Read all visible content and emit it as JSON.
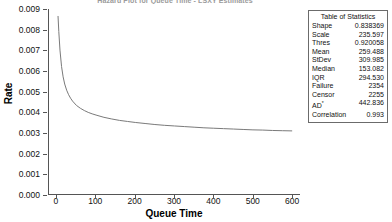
{
  "chart_data": {
    "type": "line",
    "title": "Hazard Plot for Queue Time - LSXY Estimates",
    "xlabel": "Queue Time",
    "ylabel": "Rate",
    "xlim": [
      -20,
      620
    ],
    "ylim": [
      0,
      0.009
    ],
    "grid": false,
    "legend": "none",
    "line_color": "#7a7a7a",
    "xticks": [
      "0",
      "100",
      "200",
      "300",
      "400",
      "500",
      "600"
    ],
    "xtick_values": [
      0,
      100,
      200,
      300,
      400,
      500,
      600
    ],
    "yticks": [
      "0.000",
      "0.001",
      "0.002",
      "0.003",
      "0.004",
      "0.005",
      "0.006",
      "0.007",
      "0.008",
      "0.009"
    ],
    "ytick_values": [
      0,
      0.001,
      0.002,
      0.003,
      0.004,
      0.005,
      0.006,
      0.007,
      0.008,
      0.009
    ],
    "series": [
      {
        "name": "Hazard rate",
        "x": [
          3,
          5,
          8,
          12,
          16,
          20,
          25,
          30,
          35,
          40,
          50,
          60,
          70,
          80,
          90,
          100,
          120,
          140,
          160,
          180,
          200,
          225,
          250,
          275,
          300,
          325,
          350,
          375,
          400,
          425,
          450,
          475,
          500,
          525,
          550,
          575,
          600
        ],
        "y": [
          0.00866,
          0.0079,
          0.007,
          0.0062,
          0.0057,
          0.00535,
          0.00505,
          0.00483,
          0.00466,
          0.00452,
          0.00431,
          0.00417,
          0.00406,
          0.00397,
          0.0039,
          0.00384,
          0.00373,
          0.00365,
          0.00358,
          0.00353,
          0.00348,
          0.00343,
          0.00338,
          0.00334,
          0.00331,
          0.00328,
          0.00325,
          0.00322,
          0.0032,
          0.00318,
          0.00316,
          0.00314,
          0.00312,
          0.00311,
          0.00309,
          0.00308,
          0.00307
        ]
      }
    ]
  },
  "stats_table": {
    "title": "Table of Statistics",
    "rows": [
      {
        "key": "Shape",
        "value": "0.838369"
      },
      {
        "key": "Scale",
        "value": "235.597"
      },
      {
        "key": "Thres",
        "value": "0.920058"
      },
      {
        "key": "Mean",
        "value": "259.488"
      },
      {
        "key": "StDev",
        "value": "309.985"
      },
      {
        "key": "Median",
        "value": "153.082"
      },
      {
        "key": "IQR",
        "value": "294.530"
      },
      {
        "key": "Failure",
        "value": "2354"
      },
      {
        "key": "Censor",
        "value": "2255"
      },
      {
        "key": "AD*",
        "value": "442.836"
      },
      {
        "key": "Correlation",
        "value": "0.993"
      }
    ]
  }
}
